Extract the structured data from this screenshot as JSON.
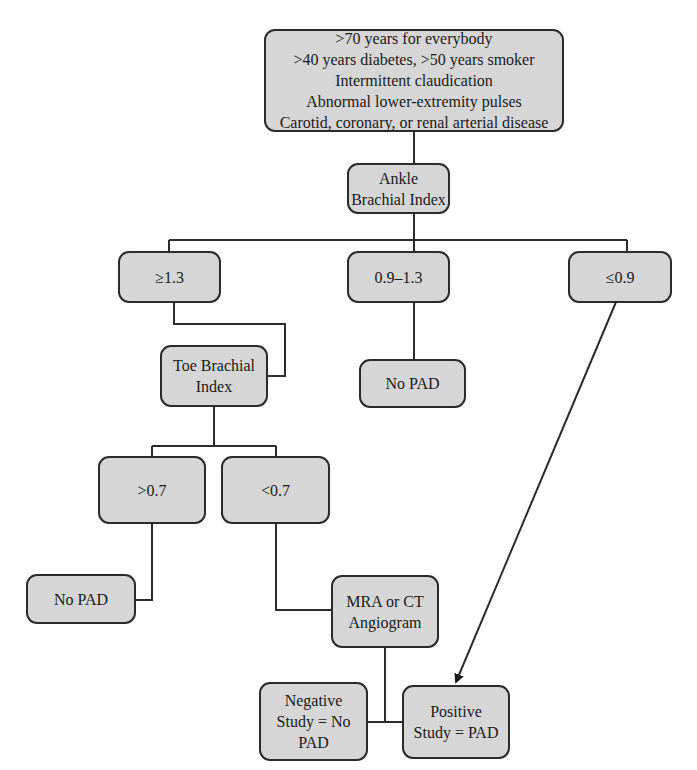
{
  "diagram": {
    "type": "flowchart",
    "nodes": {
      "criteria": {
        "lines": [
          ">70 years for everybody",
          ">40 years diabetes, >50 years smoker",
          "Intermittent claudication",
          "Abnormal lower-extremity pulses",
          "Carotid, coronary, or renal arterial disease"
        ]
      },
      "abi": {
        "lines": [
          "Ankle",
          "Brachial Index"
        ]
      },
      "abi_high": {
        "lines": [
          "≥1.3"
        ]
      },
      "abi_normal": {
        "lines": [
          "0.9–1.3"
        ]
      },
      "abi_low": {
        "lines": [
          "≤0.9"
        ]
      },
      "no_pad_mid": {
        "lines": [
          "No PAD"
        ]
      },
      "tbi": {
        "lines": [
          "Toe Brachial",
          "Index"
        ]
      },
      "tbi_high": {
        "lines": [
          ">0.7"
        ]
      },
      "tbi_low": {
        "lines": [
          "<0.7"
        ]
      },
      "no_pad_left": {
        "lines": [
          "No PAD"
        ]
      },
      "imaging": {
        "lines": [
          "MRA or CT",
          "Angiogram"
        ]
      },
      "negative": {
        "lines": [
          "Negative",
          "Study = No",
          "PAD"
        ]
      },
      "positive": {
        "lines": [
          "Positive",
          "Study = PAD"
        ]
      }
    },
    "edges": [
      {
        "from": "criteria",
        "to": "abi"
      },
      {
        "from": "abi",
        "to": "abi_high"
      },
      {
        "from": "abi",
        "to": "abi_normal"
      },
      {
        "from": "abi",
        "to": "abi_low"
      },
      {
        "from": "abi_high",
        "to": "tbi"
      },
      {
        "from": "abi_normal",
        "to": "no_pad_mid"
      },
      {
        "from": "abi_low",
        "to": "positive",
        "arrow": true
      },
      {
        "from": "tbi",
        "to": "tbi_high"
      },
      {
        "from": "tbi",
        "to": "tbi_low"
      },
      {
        "from": "tbi_high",
        "to": "no_pad_left"
      },
      {
        "from": "tbi_low",
        "to": "imaging"
      },
      {
        "from": "imaging",
        "to": "negative"
      },
      {
        "from": "imaging",
        "to": "positive"
      }
    ],
    "colors": {
      "box_fill": "#d6d6d6",
      "stroke": "#2b2b2b"
    }
  }
}
